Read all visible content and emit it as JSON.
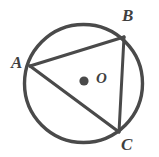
{
  "figure": {
    "type": "geometry-diagram",
    "canvas": {
      "width": 159,
      "height": 157
    },
    "background_color": "#ffffff",
    "stroke_color": "#4a4a4a",
    "label_color": "#3f3f3f",
    "circle": {
      "name": "circle-O",
      "center": {
        "x": 83.5,
        "y": 83.5
      },
      "radius": 59,
      "stroke_width": 3.4
    },
    "center_point": {
      "name": "center-point-O",
      "x": 84,
      "y": 81,
      "radius": 4.6,
      "fill": "#4a4a4a"
    },
    "vertices": [
      {
        "id": "A",
        "label": "A",
        "x": 30,
        "y": 66
      },
      {
        "id": "B",
        "label": "B",
        "x": 124,
        "y": 37
      },
      {
        "id": "C",
        "label": "C",
        "x": 119,
        "y": 132
      }
    ],
    "chords": [
      {
        "name": "chord-AB",
        "from": "A",
        "to": "B",
        "x1": 30,
        "y1": 66,
        "x2": 124,
        "y2": 37,
        "stroke_width": 3.2
      },
      {
        "name": "chord-BC",
        "from": "B",
        "to": "C",
        "x1": 124,
        "y1": 37,
        "x2": 119,
        "y2": 132,
        "stroke_width": 3.0
      },
      {
        "name": "chord-AC",
        "from": "A",
        "to": "C",
        "x1": 30,
        "y1": 66,
        "x2": 119,
        "y2": 132,
        "stroke_width": 3.2
      }
    ],
    "labels": {
      "A": "A",
      "B": "B",
      "C": "C",
      "O": "O"
    }
  }
}
